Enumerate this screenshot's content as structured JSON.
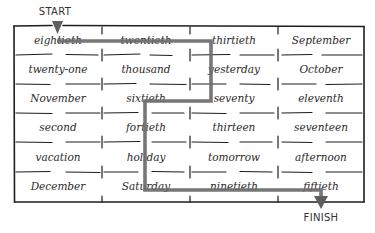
{
  "labels": {
    "start": "START",
    "finish": "FINISH"
  },
  "grid": {
    "rows": 6,
    "cols": 4,
    "cells": [
      [
        "eightieth",
        "twentieth",
        "thirtieth",
        "September"
      ],
      [
        "twenty-one",
        "thousand",
        "yesterday",
        "October"
      ],
      [
        "November",
        "sixtieth",
        "seventy",
        "eleventh"
      ],
      [
        "second",
        "fortieth",
        "thirteen",
        "seventeen"
      ],
      [
        "vacation",
        "holiday",
        "tomorrow",
        "afternoon"
      ],
      [
        "December",
        "Saturday",
        "ninetieth",
        "fiftieth"
      ]
    ]
  },
  "path": {
    "color": "#6b6b6b",
    "sequence": [
      "eightieth",
      "twentieth",
      "thirtieth",
      "yesterday",
      "seventy",
      "sixtieth",
      "fortieth",
      "holiday",
      "Saturday",
      "ninetieth",
      "fiftieth"
    ]
  },
  "colors": {
    "grid_line": "#1e1e1e",
    "text": "#2a2a2a",
    "path": "#6b6b6b"
  }
}
